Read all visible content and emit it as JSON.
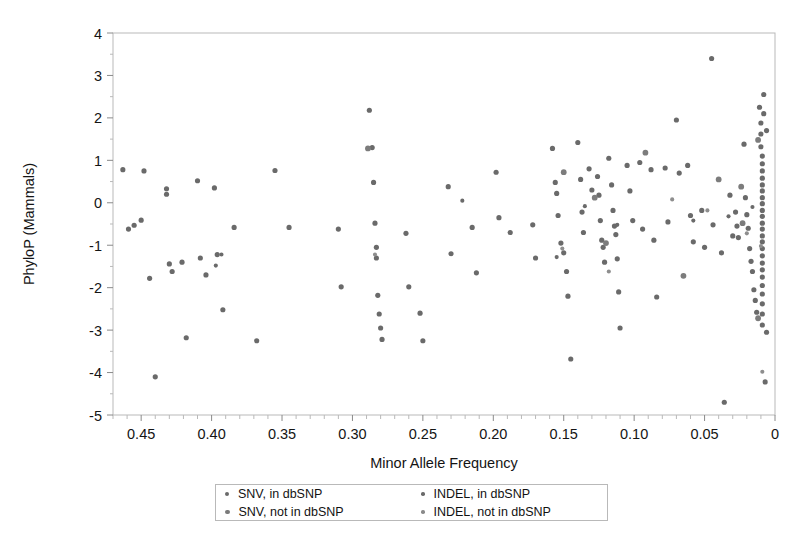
{
  "chart_data": {
    "type": "scatter",
    "title": "",
    "xlabel": "Minor Allele Frequency",
    "ylabel": "PhyloP (Mammals)",
    "xlim": [
      0.47,
      0.0
    ],
    "ylim": [
      -5,
      4
    ],
    "x_reversed": true,
    "grid": false,
    "xticks": [
      0.45,
      0.4,
      0.35,
      0.3,
      0.25,
      0.2,
      0.15,
      0.1,
      0.05,
      0.0
    ],
    "xticklabels": [
      "0.45",
      "0.40",
      "0.35",
      "0.30",
      "0.25",
      "0.20",
      "0.15",
      "0.10",
      "0.05",
      "0"
    ],
    "yticks": [
      4,
      3,
      2,
      1,
      0,
      -1,
      -2,
      -3,
      -4,
      -5
    ],
    "yticklabels": [
      "4",
      "3",
      "2",
      "1",
      "0",
      "-1",
      "-2",
      "-3",
      "-4",
      "-5"
    ],
    "x_minor_tick_step": 0.01,
    "legend_position": "below-axes",
    "marker_color": "#6a6a6a",
    "frame_color": "#b9b9b9",
    "series": [
      {
        "name": "SNV, in dbSNP",
        "marker": "circle",
        "color": "#6a6a6a",
        "size": 4,
        "points": [
          [
            0.463,
            0.78
          ],
          [
            0.459,
            -0.62
          ],
          [
            0.455,
            -0.53
          ],
          [
            0.45,
            -0.41
          ],
          [
            0.448,
            0.75
          ],
          [
            0.444,
            -1.78
          ],
          [
            0.44,
            -4.1
          ],
          [
            0.432,
            0.33
          ],
          [
            0.432,
            0.2
          ],
          [
            0.43,
            -1.44
          ],
          [
            0.428,
            -1.62
          ],
          [
            0.421,
            -1.4
          ],
          [
            0.418,
            -3.18
          ],
          [
            0.41,
            0.52
          ],
          [
            0.408,
            -1.3
          ],
          [
            0.404,
            -1.7
          ],
          [
            0.398,
            0.35
          ],
          [
            0.396,
            -1.22
          ],
          [
            0.392,
            -2.52
          ],
          [
            0.384,
            -0.58
          ],
          [
            0.368,
            -3.25
          ],
          [
            0.355,
            0.76
          ],
          [
            0.345,
            -0.58
          ],
          [
            0.31,
            -0.62
          ],
          [
            0.308,
            -1.98
          ],
          [
            0.288,
            2.18
          ],
          [
            0.286,
            1.3
          ],
          [
            0.285,
            0.48
          ],
          [
            0.284,
            -0.48
          ],
          [
            0.283,
            -1.05
          ],
          [
            0.283,
            -1.3
          ],
          [
            0.282,
            -2.18
          ],
          [
            0.281,
            -2.62
          ],
          [
            0.28,
            -2.95
          ],
          [
            0.279,
            -3.22
          ],
          [
            0.262,
            -0.72
          ],
          [
            0.26,
            -1.98
          ],
          [
            0.252,
            -2.6
          ],
          [
            0.25,
            -3.25
          ],
          [
            0.232,
            0.38
          ],
          [
            0.23,
            -1.2
          ],
          [
            0.215,
            -0.58
          ],
          [
            0.212,
            -1.65
          ],
          [
            0.198,
            0.72
          ],
          [
            0.196,
            -0.35
          ],
          [
            0.188,
            -0.7
          ],
          [
            0.172,
            -0.52
          ],
          [
            0.17,
            -1.3
          ],
          [
            0.158,
            1.28
          ],
          [
            0.156,
            0.48
          ],
          [
            0.155,
            0.22
          ],
          [
            0.154,
            -0.3
          ],
          [
            0.152,
            -0.95
          ],
          [
            0.15,
            -1.18
          ],
          [
            0.148,
            -1.62
          ],
          [
            0.147,
            -2.2
          ],
          [
            0.145,
            -3.68
          ],
          [
            0.14,
            1.42
          ],
          [
            0.138,
            0.55
          ],
          [
            0.137,
            -0.22
          ],
          [
            0.136,
            -0.7
          ],
          [
            0.132,
            0.8
          ],
          [
            0.13,
            0.3
          ],
          [
            0.126,
            0.62
          ],
          [
            0.125,
            0.18
          ],
          [
            0.124,
            -0.42
          ],
          [
            0.123,
            -0.88
          ],
          [
            0.122,
            -1.05
          ],
          [
            0.121,
            -1.4
          ],
          [
            0.118,
            1.05
          ],
          [
            0.116,
            0.42
          ],
          [
            0.115,
            -0.18
          ],
          [
            0.114,
            -0.55
          ],
          [
            0.113,
            -0.75
          ],
          [
            0.112,
            -1.32
          ],
          [
            0.111,
            -2.1
          ],
          [
            0.11,
            -2.95
          ],
          [
            0.105,
            0.88
          ],
          [
            0.103,
            0.28
          ],
          [
            0.101,
            -0.42
          ],
          [
            0.096,
            0.95
          ],
          [
            0.094,
            -0.62
          ],
          [
            0.088,
            0.78
          ],
          [
            0.086,
            -0.88
          ],
          [
            0.084,
            -2.22
          ],
          [
            0.078,
            0.82
          ],
          [
            0.076,
            -0.45
          ],
          [
            0.07,
            1.95
          ],
          [
            0.068,
            0.7
          ],
          [
            0.062,
            0.88
          ],
          [
            0.06,
            -0.3
          ],
          [
            0.058,
            -0.92
          ],
          [
            0.052,
            -0.18
          ],
          [
            0.05,
            -1.05
          ],
          [
            0.045,
            3.4
          ],
          [
            0.044,
            -0.52
          ],
          [
            0.038,
            -1.18
          ],
          [
            0.036,
            -4.7
          ],
          [
            0.032,
            0.18
          ],
          [
            0.03,
            -0.78
          ],
          [
            0.028,
            -0.22
          ],
          [
            0.027,
            -0.55
          ],
          [
            0.026,
            -0.82
          ],
          [
            0.022,
            1.38
          ],
          [
            0.021,
            0.12
          ],
          [
            0.02,
            -0.28
          ],
          [
            0.019,
            -0.6
          ],
          [
            0.018,
            -1.08
          ],
          [
            0.017,
            -1.38
          ],
          [
            0.016,
            -1.62
          ],
          [
            0.015,
            -2.05
          ],
          [
            0.014,
            -2.3
          ],
          [
            0.013,
            -2.58
          ],
          [
            0.011,
            2.25
          ],
          [
            0.01,
            1.88
          ],
          [
            0.01,
            1.62
          ],
          [
            0.01,
            1.32
          ],
          [
            0.009,
            1.1
          ],
          [
            0.009,
            0.92
          ],
          [
            0.009,
            0.75
          ],
          [
            0.009,
            0.58
          ],
          [
            0.009,
            0.42
          ],
          [
            0.009,
            0.28
          ],
          [
            0.009,
            0.12
          ],
          [
            0.009,
            -0.02
          ],
          [
            0.009,
            -0.18
          ],
          [
            0.009,
            -0.32
          ],
          [
            0.009,
            -0.48
          ],
          [
            0.009,
            -0.62
          ],
          [
            0.009,
            -0.78
          ],
          [
            0.009,
            -0.92
          ],
          [
            0.009,
            -1.08
          ],
          [
            0.009,
            -1.25
          ],
          [
            0.009,
            -1.42
          ],
          [
            0.009,
            -1.58
          ],
          [
            0.009,
            -1.75
          ],
          [
            0.009,
            -1.95
          ],
          [
            0.009,
            -2.15
          ],
          [
            0.009,
            -2.38
          ],
          [
            0.009,
            -2.62
          ],
          [
            0.009,
            -2.88
          ],
          [
            0.008,
            2.55
          ],
          [
            0.008,
            2.1
          ],
          [
            0.007,
            -4.22
          ],
          [
            0.006,
            1.7
          ],
          [
            0.006,
            -3.05
          ]
        ]
      },
      {
        "name": "SNV, not in dbSNP",
        "marker": "circle",
        "color": "#7c7c7c",
        "size": 4.5,
        "points": [
          [
            0.289,
            1.28
          ],
          [
            0.15,
            0.72
          ],
          [
            0.128,
            0.12
          ],
          [
            0.12,
            -0.95
          ],
          [
            0.092,
            1.18
          ],
          [
            0.065,
            -1.72
          ],
          [
            0.04,
            0.55
          ],
          [
            0.024,
            0.38
          ],
          [
            0.023,
            -0.48
          ],
          [
            0.012,
            1.48
          ],
          [
            0.012,
            -2.72
          ]
        ]
      },
      {
        "name": "INDEL, in dbSNP",
        "marker": "circle",
        "color": "#6a6a6a",
        "size": 3.2,
        "points": [
          [
            0.397,
            -1.48
          ],
          [
            0.393,
            -1.22
          ],
          [
            0.222,
            0.05
          ],
          [
            0.155,
            -1.28
          ],
          [
            0.135,
            -0.08
          ],
          [
            0.112,
            -0.52
          ],
          [
            0.058,
            -0.42
          ],
          [
            0.033,
            -0.32
          ],
          [
            0.016,
            -0.1
          ]
        ]
      },
      {
        "name": "INDEL, not in dbSNP",
        "marker": "circle",
        "color": "#8e8e8e",
        "size": 3.2,
        "points": [
          [
            0.284,
            -1.22
          ],
          [
            0.151,
            -1.08
          ],
          [
            0.118,
            -1.62
          ],
          [
            0.073,
            0.08
          ],
          [
            0.048,
            -0.18
          ],
          [
            0.02,
            -0.72
          ],
          [
            0.01,
            -1.02
          ],
          [
            0.009,
            -3.98
          ]
        ]
      }
    ]
  },
  "legend": {
    "entries": [
      {
        "label": "SNV, in dbSNP",
        "marker_class": "lm-snv-in"
      },
      {
        "label": "INDEL, in dbSNP",
        "marker_class": "lm-indel-in"
      },
      {
        "label": "SNV, not in dbSNP",
        "marker_class": "lm-snv-notin"
      },
      {
        "label": "INDEL, not in dbSNP",
        "marker_class": "lm-indel-notin"
      }
    ]
  }
}
